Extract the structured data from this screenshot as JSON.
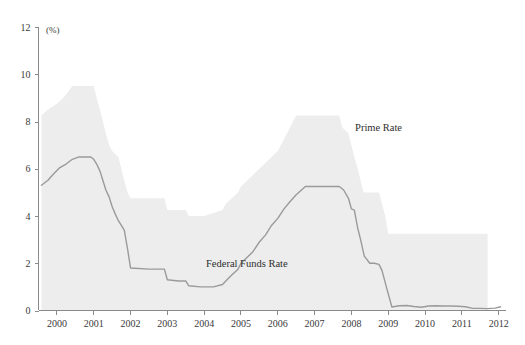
{
  "chart_data": {
    "type": "area",
    "title": "",
    "xlabel": "",
    "ylabel": "",
    "y_unit": "(%)",
    "xlim": [
      1999.5,
      2012.2
    ],
    "ylim": [
      0,
      12
    ],
    "grid": false,
    "legend_position": "inline-annotations",
    "y_ticks": [
      0,
      2,
      4,
      6,
      8,
      10,
      12
    ],
    "y_tick_labels": [
      "0",
      "2",
      "4",
      "6",
      "8",
      "10",
      "12"
    ],
    "x_ticks": [
      2000,
      2001,
      2002,
      2003,
      2004,
      2005,
      2006,
      2007,
      2008,
      2009,
      2010,
      2011,
      2012
    ],
    "x_tick_labels": [
      "2000",
      "2001",
      "2002",
      "2003",
      "2004",
      "2005",
      "2006",
      "2007",
      "2008",
      "2009",
      "2010",
      "2011",
      "2012"
    ],
    "annotations": [
      {
        "text": "Prime Rate",
        "x": 2008.1,
        "y": 7.6
      },
      {
        "text": "Federal Funds Rate",
        "x": 2004.05,
        "y": 1.85
      }
    ],
    "series": [
      {
        "name": "Prime Rate",
        "render": "area",
        "color": "#ededed",
        "x": [
          1999.58,
          1999.75,
          2000.0,
          2000.17,
          2000.3,
          2000.42,
          2000.55,
          2001.0,
          2001.08,
          2001.17,
          2001.25,
          2001.33,
          2001.42,
          2001.5,
          2001.67,
          2001.75,
          2001.83,
          2001.92,
          2002.0,
          2002.92,
          2003.0,
          2003.5,
          2003.58,
          2004.0,
          2004.5,
          2004.58,
          2004.75,
          2004.92,
          2005.0,
          2005.17,
          2005.33,
          2005.5,
          2005.67,
          2005.83,
          2006.0,
          2006.17,
          2006.33,
          2006.5,
          2007.0,
          2007.67,
          2007.75,
          2007.92,
          2008.0,
          2008.08,
          2008.17,
          2008.25,
          2008.33,
          2008.75,
          2008.92,
          2009.0,
          2011.7
        ],
        "y": [
          8.25,
          8.5,
          8.75,
          9.0,
          9.25,
          9.5,
          9.5,
          9.5,
          9.0,
          8.5,
          8.0,
          7.5,
          7.0,
          6.75,
          6.5,
          6.0,
          5.5,
          5.0,
          4.75,
          4.75,
          4.25,
          4.25,
          4.0,
          4.0,
          4.25,
          4.5,
          4.75,
          5.0,
          5.25,
          5.5,
          5.75,
          6.0,
          6.25,
          6.5,
          6.75,
          7.25,
          7.75,
          8.25,
          8.25,
          8.25,
          7.75,
          7.5,
          7.0,
          6.5,
          6.0,
          5.5,
          5.0,
          5.0,
          4.0,
          3.25,
          3.25
        ]
      },
      {
        "name": "Federal Funds Rate",
        "render": "line",
        "color": "#9a9a9a",
        "x": [
          1999.58,
          1999.75,
          1999.92,
          2000.08,
          2000.25,
          2000.42,
          2000.6,
          2000.92,
          2001.0,
          2001.08,
          2001.17,
          2001.25,
          2001.33,
          2001.42,
          2001.5,
          2001.58,
          2001.67,
          2001.75,
          2001.83,
          2001.92,
          2002.0,
          2002.5,
          2002.92,
          2003.0,
          2003.3,
          2003.5,
          2003.58,
          2003.9,
          2004.0,
          2004.25,
          2004.5,
          2004.62,
          2004.75,
          2004.92,
          2005.0,
          2005.17,
          2005.33,
          2005.5,
          2005.67,
          2005.83,
          2006.0,
          2006.17,
          2006.33,
          2006.5,
          2006.75,
          2007.0,
          2007.5,
          2007.67,
          2007.79,
          2007.92,
          2008.0,
          2008.08,
          2008.17,
          2008.25,
          2008.35,
          2008.5,
          2008.62,
          2008.75,
          2008.83,
          2008.95,
          2009.1,
          2009.3,
          2009.5,
          2009.7,
          2009.9,
          2010.1,
          2010.3,
          2010.5,
          2010.7,
          2010.9,
          2011.1,
          2011.3,
          2011.5,
          2011.7,
          2011.9,
          2012.05
        ],
        "y": [
          5.3,
          5.5,
          5.8,
          6.05,
          6.2,
          6.4,
          6.5,
          6.5,
          6.4,
          6.2,
          5.9,
          5.5,
          5.1,
          4.8,
          4.4,
          4.1,
          3.8,
          3.6,
          3.4,
          2.6,
          1.8,
          1.75,
          1.75,
          1.3,
          1.25,
          1.25,
          1.05,
          1.0,
          1.0,
          1.0,
          1.1,
          1.3,
          1.5,
          1.75,
          2.0,
          2.25,
          2.5,
          2.9,
          3.2,
          3.6,
          3.9,
          4.3,
          4.6,
          4.9,
          5.25,
          5.25,
          5.25,
          5.25,
          5.1,
          4.75,
          4.3,
          4.25,
          3.5,
          3.0,
          2.3,
          2.0,
          2.0,
          1.95,
          1.7,
          1.0,
          0.15,
          0.2,
          0.21,
          0.17,
          0.14,
          0.19,
          0.2,
          0.19,
          0.19,
          0.18,
          0.16,
          0.09,
          0.09,
          0.08,
          0.1,
          0.16
        ]
      }
    ]
  }
}
